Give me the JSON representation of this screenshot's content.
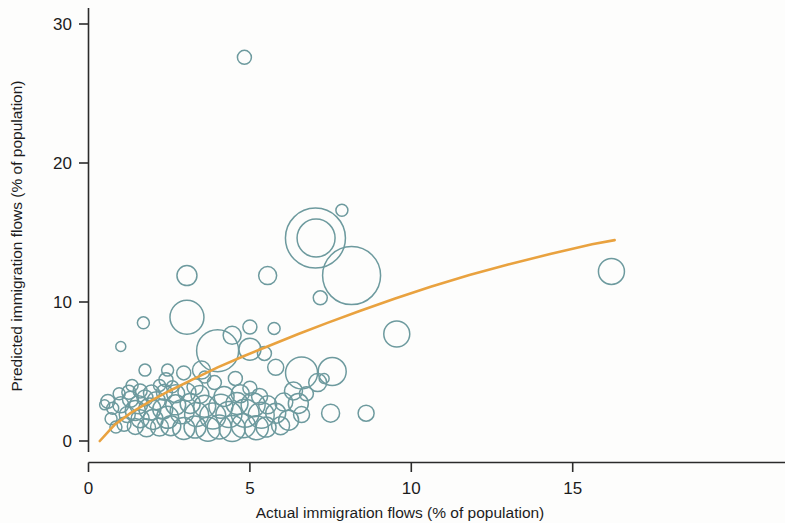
{
  "chart_data": {
    "type": "scatter",
    "variant": "bubble",
    "title": "",
    "xlabel": "Actual immigration flows (% of population)",
    "ylabel": "Predicted immigration flows (% of population)",
    "xlim": [
      -0.15,
      16.4
    ],
    "ylim": [
      -1.0,
      30.6
    ],
    "xticks": [
      0,
      5,
      10,
      15
    ],
    "xticklabels": [
      "0",
      "5",
      "10",
      "15"
    ],
    "yticks": [
      0,
      10,
      20,
      30
    ],
    "yticklabels": [
      "0",
      "10",
      "20",
      "30"
    ],
    "grid": false,
    "legend": null,
    "marker_style": "open circle",
    "marker_color": "#6d9a9e",
    "fit_color": "#e9a23f",
    "size_encoding": "bubble area encodes country population",
    "fit_curve": {
      "name": "fitted trend",
      "description": "concave increasing logarithmic fit",
      "x": [
        0.35,
        0.8,
        1.3,
        1.9,
        2.5,
        3.2,
        4.0,
        4.8,
        5.6,
        6.5,
        7.4,
        8.4,
        9.5,
        10.6,
        11.8,
        13.0,
        14.3,
        15.6,
        16.3
      ],
      "y": [
        0.0,
        1.15,
        2.0,
        2.85,
        3.6,
        4.4,
        5.3,
        6.1,
        6.85,
        7.7,
        8.5,
        9.35,
        10.25,
        11.1,
        11.95,
        12.7,
        13.45,
        14.15,
        14.45
      ]
    },
    "points": [
      {
        "x": 4.83,
        "y": 27.6,
        "r": 7
      },
      {
        "x": 7.03,
        "y": 14.6,
        "r": 30
      },
      {
        "x": 7.05,
        "y": 14.6,
        "r": 19
      },
      {
        "x": 8.15,
        "y": 11.9,
        "r": 29
      },
      {
        "x": 7.85,
        "y": 16.6,
        "r": 6
      },
      {
        "x": 7.18,
        "y": 10.3,
        "r": 7
      },
      {
        "x": 16.2,
        "y": 12.2,
        "r": 13
      },
      {
        "x": 9.55,
        "y": 7.7,
        "r": 13
      },
      {
        "x": 3.05,
        "y": 11.9,
        "r": 10
      },
      {
        "x": 5.55,
        "y": 11.9,
        "r": 9
      },
      {
        "x": 3.05,
        "y": 8.9,
        "r": 17
      },
      {
        "x": 1.7,
        "y": 8.5,
        "r": 6
      },
      {
        "x": 1.0,
        "y": 6.8,
        "r": 5
      },
      {
        "x": 4.45,
        "y": 7.6,
        "r": 9
      },
      {
        "x": 5.0,
        "y": 8.2,
        "r": 7
      },
      {
        "x": 5.75,
        "y": 8.1,
        "r": 6
      },
      {
        "x": 4.0,
        "y": 6.5,
        "r": 21
      },
      {
        "x": 5.0,
        "y": 6.6,
        "r": 11
      },
      {
        "x": 5.45,
        "y": 6.3,
        "r": 7
      },
      {
        "x": 5.8,
        "y": 5.3,
        "r": 8
      },
      {
        "x": 3.5,
        "y": 5.1,
        "r": 9
      },
      {
        "x": 2.95,
        "y": 4.9,
        "r": 7
      },
      {
        "x": 6.6,
        "y": 4.9,
        "r": 16
      },
      {
        "x": 7.1,
        "y": 4.2,
        "r": 9
      },
      {
        "x": 7.55,
        "y": 5.0,
        "r": 14
      },
      {
        "x": 7.3,
        "y": 4.5,
        "r": 5
      },
      {
        "x": 6.5,
        "y": 2.7,
        "r": 10
      },
      {
        "x": 7.5,
        "y": 2.0,
        "r": 9
      },
      {
        "x": 8.6,
        "y": 2.0,
        "r": 8
      },
      {
        "x": 6.6,
        "y": 1.9,
        "r": 8
      },
      {
        "x": 0.6,
        "y": 2.85,
        "r": 7
      },
      {
        "x": 1.0,
        "y": 2.6,
        "r": 8
      },
      {
        "x": 1.3,
        "y": 3.0,
        "r": 8
      },
      {
        "x": 1.55,
        "y": 2.6,
        "r": 9
      },
      {
        "x": 1.75,
        "y": 3.1,
        "r": 8
      },
      {
        "x": 1.45,
        "y": 2.2,
        "r": 10
      },
      {
        "x": 1.2,
        "y": 1.9,
        "r": 8
      },
      {
        "x": 1.6,
        "y": 1.6,
        "r": 9
      },
      {
        "x": 1.9,
        "y": 2.3,
        "r": 11
      },
      {
        "x": 2.1,
        "y": 2.9,
        "r": 9
      },
      {
        "x": 2.3,
        "y": 2.3,
        "r": 10
      },
      {
        "x": 2.0,
        "y": 1.55,
        "r": 10
      },
      {
        "x": 2.45,
        "y": 1.7,
        "r": 11
      },
      {
        "x": 2.7,
        "y": 2.6,
        "r": 10
      },
      {
        "x": 2.9,
        "y": 2.1,
        "r": 12
      },
      {
        "x": 3.15,
        "y": 2.7,
        "r": 10
      },
      {
        "x": 3.35,
        "y": 1.9,
        "r": 12
      },
      {
        "x": 3.6,
        "y": 2.5,
        "r": 11
      },
      {
        "x": 3.85,
        "y": 1.8,
        "r": 13
      },
      {
        "x": 4.1,
        "y": 2.5,
        "r": 12
      },
      {
        "x": 4.35,
        "y": 1.9,
        "r": 13
      },
      {
        "x": 4.6,
        "y": 2.7,
        "r": 11
      },
      {
        "x": 4.85,
        "y": 2.0,
        "r": 14
      },
      {
        "x": 5.1,
        "y": 2.6,
        "r": 12
      },
      {
        "x": 5.35,
        "y": 1.85,
        "r": 13
      },
      {
        "x": 1.1,
        "y": 1.2,
        "r": 7
      },
      {
        "x": 1.45,
        "y": 1.05,
        "r": 8
      },
      {
        "x": 1.8,
        "y": 0.95,
        "r": 9
      },
      {
        "x": 2.2,
        "y": 1.0,
        "r": 9
      },
      {
        "x": 2.55,
        "y": 1.1,
        "r": 10
      },
      {
        "x": 2.95,
        "y": 0.9,
        "r": 11
      },
      {
        "x": 3.3,
        "y": 1.0,
        "r": 11
      },
      {
        "x": 3.7,
        "y": 0.85,
        "r": 12
      },
      {
        "x": 4.05,
        "y": 1.0,
        "r": 12
      },
      {
        "x": 4.45,
        "y": 0.9,
        "r": 13
      },
      {
        "x": 4.8,
        "y": 1.1,
        "r": 12
      },
      {
        "x": 5.2,
        "y": 0.95,
        "r": 12
      },
      {
        "x": 0.95,
        "y": 3.4,
        "r": 6
      },
      {
        "x": 1.25,
        "y": 3.5,
        "r": 7
      },
      {
        "x": 1.6,
        "y": 3.6,
        "r": 7
      },
      {
        "x": 1.95,
        "y": 3.45,
        "r": 8
      },
      {
        "x": 2.35,
        "y": 3.5,
        "r": 8
      },
      {
        "x": 2.7,
        "y": 3.4,
        "r": 9
      },
      {
        "x": 3.05,
        "y": 3.5,
        "r": 9
      },
      {
        "x": 3.45,
        "y": 3.35,
        "r": 9
      },
      {
        "x": 0.5,
        "y": 2.6,
        "r": 5
      },
      {
        "x": 0.75,
        "y": 2.35,
        "r": 6
      },
      {
        "x": 2.2,
        "y": 4.0,
        "r": 6
      },
      {
        "x": 2.6,
        "y": 3.9,
        "r": 6
      },
      {
        "x": 1.35,
        "y": 4.0,
        "r": 6
      },
      {
        "x": 4.2,
        "y": 3.2,
        "r": 10
      },
      {
        "x": 4.7,
        "y": 3.4,
        "r": 9
      },
      {
        "x": 5.0,
        "y": 3.8,
        "r": 7
      },
      {
        "x": 5.3,
        "y": 3.2,
        "r": 8
      },
      {
        "x": 5.55,
        "y": 2.6,
        "r": 9
      },
      {
        "x": 5.8,
        "y": 2.0,
        "r": 10
      },
      {
        "x": 6.05,
        "y": 2.8,
        "r": 9
      },
      {
        "x": 6.2,
        "y": 1.5,
        "r": 10
      },
      {
        "x": 5.95,
        "y": 1.1,
        "r": 9
      },
      {
        "x": 5.5,
        "y": 1.0,
        "r": 10
      },
      {
        "x": 3.9,
        "y": 4.2,
        "r": 7
      },
      {
        "x": 3.6,
        "y": 4.6,
        "r": 6
      },
      {
        "x": 4.55,
        "y": 4.5,
        "r": 7
      },
      {
        "x": 1.75,
        "y": 5.1,
        "r": 6
      },
      {
        "x": 2.45,
        "y": 5.1,
        "r": 6
      },
      {
        "x": 2.4,
        "y": 4.4,
        "r": 7
      },
      {
        "x": 3.3,
        "y": 3.9,
        "r": 8
      },
      {
        "x": 0.85,
        "y": 1.0,
        "r": 6
      },
      {
        "x": 0.7,
        "y": 1.6,
        "r": 6
      },
      {
        "x": 6.35,
        "y": 3.6,
        "r": 9
      },
      {
        "x": 6.75,
        "y": 3.4,
        "r": 7
      }
    ]
  },
  "axes": {
    "xlabel": "Actual immigration flows (% of population)",
    "ylabel": "Predicted immigration flows (% of population)"
  }
}
